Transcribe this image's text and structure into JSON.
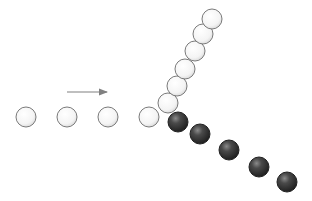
{
  "diagram": {
    "type": "collision-strobe",
    "ball_radius": 10,
    "colors": {
      "incoming_ball_fill": "#ffffff",
      "incoming_ball_stroke": "#7a7a7a",
      "target_ball_fill": "#3a3a3a",
      "target_ball_stroke": "#222222",
      "arrow": "#808080"
    },
    "direction_arrow": {
      "x1": 67,
      "y1": 92,
      "x2": 107,
      "y2": 92
    },
    "incoming_path": [
      {
        "x": 26,
        "y": 117
      },
      {
        "x": 67,
        "y": 117
      },
      {
        "x": 108,
        "y": 117
      },
      {
        "x": 149,
        "y": 117
      }
    ],
    "scattered_white_path": [
      {
        "x": 168,
        "y": 103
      },
      {
        "x": 177,
        "y": 86
      },
      {
        "x": 185,
        "y": 69
      },
      {
        "x": 195,
        "y": 51
      },
      {
        "x": 203,
        "y": 34
      },
      {
        "x": 212,
        "y": 19
      }
    ],
    "scattered_dark_path": [
      {
        "x": 178,
        "y": 122
      },
      {
        "x": 200,
        "y": 134
      },
      {
        "x": 229,
        "y": 150
      },
      {
        "x": 259,
        "y": 167
      },
      {
        "x": 287,
        "y": 182
      }
    ]
  }
}
